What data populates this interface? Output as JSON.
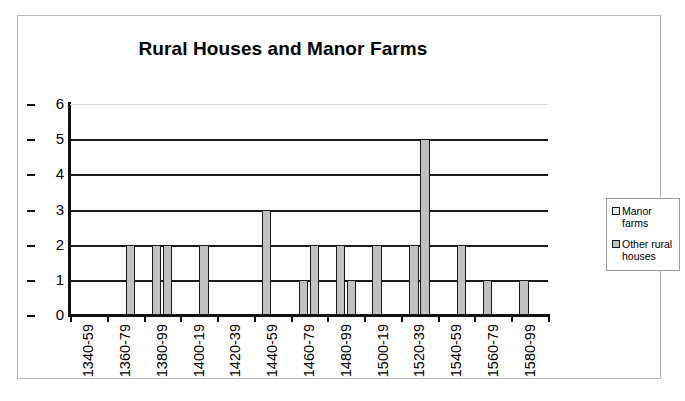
{
  "chart_data": {
    "type": "bar",
    "title": "Rural Houses and Manor Farms",
    "xlabel": "",
    "ylabel": "",
    "ylim": [
      0,
      6
    ],
    "yticks": [
      0,
      1,
      2,
      3,
      4,
      5,
      6
    ],
    "grid": true,
    "legend_position": "right",
    "categories": [
      "1340-59",
      "1360-79",
      "1380-99",
      "1400-19",
      "1420-39",
      "1440-59",
      "1460-79",
      "1480-99",
      "1500-19",
      "1520-39",
      "1540-59",
      "1560-79",
      "1580-99"
    ],
    "series": [
      {
        "name": "Manor farms",
        "color": "#c0c0c0",
        "values": [
          0,
          0,
          2,
          0,
          0,
          3,
          1,
          2,
          2,
          2,
          0,
          1,
          1
        ]
      },
      {
        "name": "Other rural houses",
        "color": "#c0c0c0",
        "values": [
          0,
          2,
          2,
          2,
          0,
          0,
          2,
          1,
          0,
          5,
          2,
          0,
          0
        ]
      }
    ]
  },
  "legend": {
    "entries": [
      {
        "label": "Manor farms",
        "swatch": "manor-farms-swatch"
      },
      {
        "label": "Other rural houses",
        "swatch": "other-rural-houses-swatch"
      }
    ]
  }
}
